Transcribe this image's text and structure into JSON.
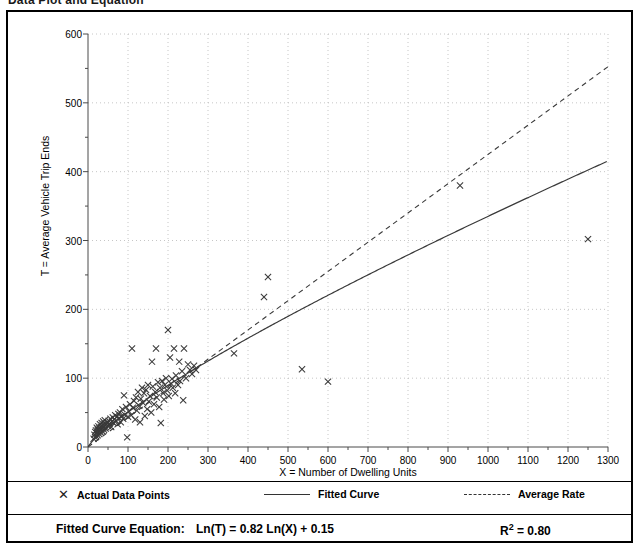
{
  "page": {
    "clipped_heading": "Data Plot and Equation"
  },
  "chart_data": {
    "type": "scatter",
    "title": "",
    "xlabel": "X = Number of Dwelling Units",
    "ylabel": "T = Average Vehicle Trip Ends",
    "xlim": [
      0,
      1300
    ],
    "ylim": [
      0,
      600
    ],
    "xticks": [
      0,
      100,
      200,
      300,
      400,
      500,
      600,
      700,
      800,
      900,
      1000,
      1100,
      1200,
      1300
    ],
    "yticks": [
      0,
      100,
      200,
      300,
      400,
      500,
      600
    ],
    "grid": true,
    "legend_position": "below-axes",
    "legend": [
      {
        "marker": "x",
        "label": "Actual Data Points"
      },
      {
        "marker": "solid-line",
        "label": "Fitted Curve"
      },
      {
        "marker": "dashed-line",
        "label": "Average Rate"
      }
    ],
    "annotations": {
      "equation_label": "Fitted Curve Equation:",
      "equation": "Ln(T) = 0.82 Ln(X) + 0.15",
      "r_squared_label": "R",
      "r_squared_sup": "2",
      "r_squared_value": "= 0.80"
    },
    "series": [
      {
        "name": "Actual Data Points",
        "marker": "x",
        "color": "#333333",
        "points": [
          [
            14,
            12
          ],
          [
            16,
            18
          ],
          [
            18,
            14
          ],
          [
            18,
            22
          ],
          [
            20,
            16
          ],
          [
            20,
            24
          ],
          [
            22,
            20
          ],
          [
            22,
            28
          ],
          [
            24,
            17
          ],
          [
            24,
            25
          ],
          [
            26,
            22
          ],
          [
            26,
            30
          ],
          [
            28,
            19
          ],
          [
            28,
            27
          ],
          [
            30,
            24
          ],
          [
            30,
            33
          ],
          [
            32,
            21
          ],
          [
            32,
            29
          ],
          [
            34,
            26
          ],
          [
            34,
            35
          ],
          [
            36,
            23
          ],
          [
            36,
            31
          ],
          [
            38,
            28
          ],
          [
            38,
            37
          ],
          [
            40,
            25
          ],
          [
            40,
            34
          ],
          [
            42,
            30
          ],
          [
            42,
            39
          ],
          [
            44,
            27
          ],
          [
            46,
            33
          ],
          [
            48,
            36
          ],
          [
            50,
            31
          ],
          [
            52,
            38
          ],
          [
            54,
            34
          ],
          [
            56,
            41
          ],
          [
            58,
            29
          ],
          [
            60,
            37
          ],
          [
            62,
            43
          ],
          [
            64,
            35
          ],
          [
            66,
            40
          ],
          [
            68,
            46
          ],
          [
            70,
            38
          ],
          [
            72,
            44
          ],
          [
            74,
            33
          ],
          [
            76,
            48
          ],
          [
            78,
            42
          ],
          [
            80,
            50
          ],
          [
            82,
            36
          ],
          [
            84,
            45
          ],
          [
            86,
            55
          ],
          [
            88,
            41
          ],
          [
            90,
            75
          ],
          [
            92,
            47
          ],
          [
            95,
            58
          ],
          [
            98,
            14
          ],
          [
            100,
            44
          ],
          [
            102,
            52
          ],
          [
            105,
            62
          ],
          [
            108,
            46
          ],
          [
            110,
            143
          ],
          [
            112,
            57
          ],
          [
            115,
            67
          ],
          [
            118,
            40
          ],
          [
            120,
            72
          ],
          [
            122,
            53
          ],
          [
            125,
            80
          ],
          [
            128,
            60
          ],
          [
            130,
            36
          ],
          [
            132,
            70
          ],
          [
            135,
            86
          ],
          [
            138,
            64
          ],
          [
            140,
            78
          ],
          [
            142,
            45
          ],
          [
            145,
            83
          ],
          [
            148,
            55
          ],
          [
            150,
            90
          ],
          [
            152,
            66
          ],
          [
            155,
            74
          ],
          [
            158,
            50
          ],
          [
            160,
            124
          ],
          [
            162,
            88
          ],
          [
            165,
            62
          ],
          [
            168,
            80
          ],
          [
            170,
            143
          ],
          [
            172,
            72
          ],
          [
            175,
            94
          ],
          [
            178,
            58
          ],
          [
            180,
            86
          ],
          [
            182,
            35
          ],
          [
            185,
            96
          ],
          [
            188,
            78
          ],
          [
            190,
            69
          ],
          [
            192,
            90
          ],
          [
            195,
            100
          ],
          [
            198,
            82
          ],
          [
            200,
            170
          ],
          [
            202,
            74
          ],
          [
            205,
            130
          ],
          [
            208,
            92
          ],
          [
            210,
            99
          ],
          [
            212,
            86
          ],
          [
            215,
            143
          ],
          [
            218,
            78
          ],
          [
            220,
            104
          ],
          [
            225,
            90
          ],
          [
            228,
            124
          ],
          [
            230,
            96
          ],
          [
            235,
            110
          ],
          [
            238,
            68
          ],
          [
            240,
            143
          ],
          [
            245,
            100
          ],
          [
            250,
            120
          ],
          [
            255,
            112
          ],
          [
            260,
            106
          ],
          [
            265,
            118
          ],
          [
            270,
            112
          ],
          [
            365,
            136
          ],
          [
            440,
            218
          ],
          [
            450,
            247
          ],
          [
            535,
            113
          ],
          [
            600,
            95
          ],
          [
            930,
            380
          ],
          [
            1250,
            302
          ]
        ]
      }
    ],
    "fitted_curve": {
      "name": "Fitted Curve",
      "style": "solid",
      "equation": "T = exp(0.15) * X^0.82",
      "slope_ln": 0.82,
      "intercept_ln": 0.15
    },
    "average_rate": {
      "name": "Average Rate",
      "style": "dashed",
      "through_origin": true,
      "rate": 0.425
    }
  }
}
